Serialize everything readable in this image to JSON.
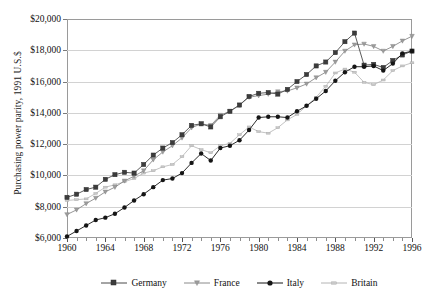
{
  "chart_data": {
    "type": "line",
    "title": "",
    "xlabel": "",
    "ylabel": "Purchasing power parity, 1991 U.S.$",
    "xlim": [
      1960,
      1996
    ],
    "ylim": [
      6000,
      20000
    ],
    "ytick_labels": [
      "$6,000",
      "$8,000",
      "$10,000",
      "$12,000",
      "$14,000",
      "$16,000",
      "$18,000",
      "$20,000"
    ],
    "ytick_values": [
      6000,
      8000,
      10000,
      12000,
      14000,
      16000,
      18000,
      20000
    ],
    "xtick_labels": [
      "1960",
      "1964",
      "1968",
      "1972",
      "1976",
      "1980",
      "1984",
      "1988",
      "1992",
      "1996"
    ],
    "xtick_values": [
      1960,
      1964,
      1968,
      1972,
      1976,
      1980,
      1984,
      1988,
      1992,
      1996
    ],
    "x_minor_step": 1,
    "grid": "horizontal",
    "legend_position": "bottom",
    "x": [
      1960,
      1961,
      1962,
      1963,
      1964,
      1965,
      1966,
      1967,
      1968,
      1969,
      1970,
      1971,
      1972,
      1973,
      1974,
      1975,
      1976,
      1977,
      1978,
      1979,
      1980,
      1981,
      1982,
      1983,
      1984,
      1985,
      1986,
      1987,
      1988,
      1989,
      1990,
      1991,
      1992,
      1993,
      1994,
      1995,
      1996
    ],
    "series": [
      {
        "name": "Germany",
        "color": "#4a4a4a",
        "marker": "square",
        "marker_fill": "#3c3c3c",
        "values": [
          8600,
          8800,
          9100,
          9250,
          9750,
          10050,
          10200,
          10150,
          10700,
          11300,
          11750,
          12100,
          12600,
          13200,
          13300,
          13100,
          13750,
          14100,
          14500,
          15050,
          15250,
          15300,
          15200,
          15500,
          16000,
          16450,
          17000,
          17250,
          17850,
          18550,
          19100,
          17050,
          17100,
          16900,
          17350,
          17700,
          17950
        ]
      },
      {
        "name": "France",
        "color": "#8a8a8a",
        "marker": "triangle",
        "marker_fill": "#9c9c9c",
        "values": [
          7500,
          7800,
          8200,
          8550,
          8950,
          9250,
          9650,
          9950,
          10300,
          11000,
          11500,
          11900,
          12400,
          13050,
          13300,
          13200,
          13850,
          14100,
          14500,
          15000,
          15100,
          15200,
          15350,
          15400,
          15600,
          15850,
          16250,
          16600,
          17250,
          17950,
          18350,
          18400,
          18250,
          17950,
          18250,
          18600,
          18900
        ]
      },
      {
        "name": "Italy",
        "color": "#151515",
        "marker": "circle",
        "marker_fill": "#151515",
        "values": [
          6100,
          6450,
          6800,
          7150,
          7300,
          7550,
          7950,
          8400,
          8800,
          9250,
          9700,
          9800,
          10150,
          10800,
          11400,
          10950,
          11750,
          11900,
          12250,
          12900,
          13700,
          13750,
          13750,
          13700,
          14100,
          14450,
          14900,
          15400,
          16050,
          16600,
          16950,
          16950,
          17000,
          16700,
          17150,
          17800,
          17950
        ]
      },
      {
        "name": "Britain",
        "color": "#b4b4b4",
        "marker": "dash",
        "marker_fill": "#c8c8c8",
        "values": [
          8400,
          8450,
          8500,
          8850,
          9250,
          9400,
          9600,
          9800,
          10150,
          10300,
          10550,
          10700,
          11200,
          11900,
          11650,
          11450,
          11900,
          12050,
          12600,
          13100,
          12800,
          12700,
          13050,
          13550,
          13900,
          14450,
          15000,
          15700,
          16550,
          16800,
          16600,
          15950,
          15800,
          16100,
          16700,
          17000,
          17200
        ]
      }
    ]
  },
  "legend": {
    "items": [
      {
        "label": "Germany"
      },
      {
        "label": "France"
      },
      {
        "label": "Italy"
      },
      {
        "label": "Britain"
      }
    ]
  }
}
